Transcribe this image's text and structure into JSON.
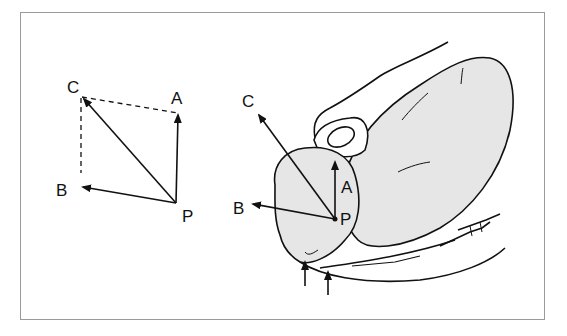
{
  "figure": {
    "left_diagram": {
      "title": "vector parallelogram",
      "labels": {
        "C": "C",
        "A": "A",
        "B": "B",
        "P": "P"
      }
    },
    "right_diagram": {
      "title": "anatomical force vectors",
      "labels": {
        "C": "C",
        "A": "A",
        "B": "B",
        "P": "P"
      },
      "arrows_below": 2
    },
    "colors": {
      "line": "#111111",
      "fill": "#e6e6e6",
      "frame": "#9a9a9a"
    }
  }
}
